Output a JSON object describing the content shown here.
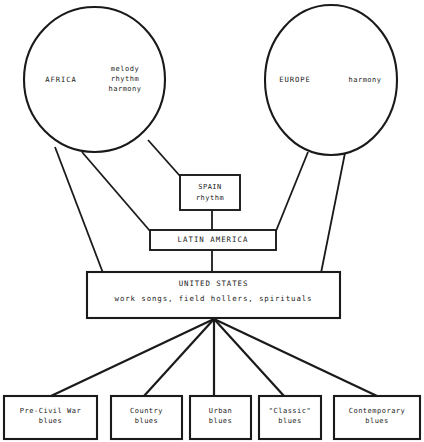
{
  "diagram": {
    "stroke_color": "#1a1a1a",
    "fill_color": "#ffffff",
    "nodes": {
      "africa": {
        "label": "AFRICA",
        "contributions": "melody\nrhythm\nharmony",
        "contributions_lines": [
          "melody",
          "rhythm",
          "harmony"
        ],
        "shape": "circle"
      },
      "europe": {
        "label": "EUROPE",
        "contributions": "harmony",
        "contributions_lines": [
          "harmony"
        ],
        "shape": "circle"
      },
      "spain": {
        "label": "SPAIN",
        "contributions": "rhythm",
        "shape": "box"
      },
      "latin_america": {
        "label": "LATIN AMERICA",
        "shape": "box"
      },
      "united_states": {
        "label": "UNITED STATES",
        "contributions": "work songs, field hollers, spirituals",
        "shape": "box"
      }
    },
    "branches": [
      {
        "line1": "Pre-Civil War",
        "line2": "blues"
      },
      {
        "line1": "Country",
        "line2": "blues"
      },
      {
        "line1": "Urban",
        "line2": "blues"
      },
      {
        "line1": "\"Classic\"",
        "line2": "blues"
      },
      {
        "line1": "Contemporary",
        "line2": "blues"
      }
    ]
  }
}
